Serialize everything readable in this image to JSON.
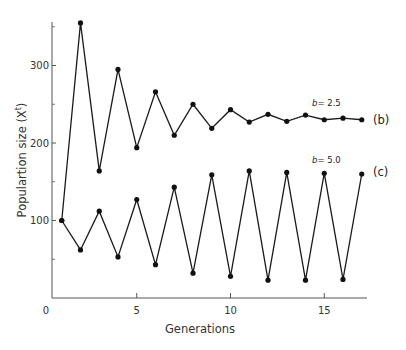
{
  "chart_data": {
    "type": "line",
    "title": "",
    "xlabel": "Generations",
    "ylabel": "Populartion size (X",
    "ylabel_superscript": "t",
    "ylabel_suffix": ")",
    "xlim": [
      0,
      17.5
    ],
    "ylim": [
      0,
      355
    ],
    "grid": false,
    "legend": "inline labels at right",
    "x_ticks": [
      0,
      5,
      10,
      15
    ],
    "x_tick_labels": [
      "0",
      "5",
      "10",
      "15"
    ],
    "y_ticks_major": [
      100,
      200,
      300
    ],
    "y_tick_labels": [
      "100",
      "200",
      "300"
    ],
    "y_ticks_minor": [
      50,
      150,
      250,
      350
    ],
    "x": [
      1,
      2,
      3,
      4,
      5,
      6,
      7,
      8,
      9,
      10,
      11,
      12,
      13,
      14,
      15,
      16,
      17
    ],
    "series": [
      {
        "name": "(b)",
        "parameter_symbol": "b",
        "parameter_value": "= 2.5",
        "values": [
          100,
          355,
          164,
          295,
          194,
          266,
          210,
          250,
          219,
          243,
          227,
          237,
          228,
          236,
          230,
          232,
          230
        ]
      },
      {
        "name": "(c)",
        "parameter_symbol": "b",
        "parameter_value": "= 5.0",
        "values": [
          100,
          62,
          112,
          53,
          127,
          43,
          143,
          32,
          159,
          28,
          164,
          23,
          162,
          23,
          161,
          24,
          160
        ]
      }
    ]
  },
  "colors": {
    "line": "#1a1a1a",
    "marker": "#111111",
    "axis": "#555555",
    "text": "#333333"
  }
}
